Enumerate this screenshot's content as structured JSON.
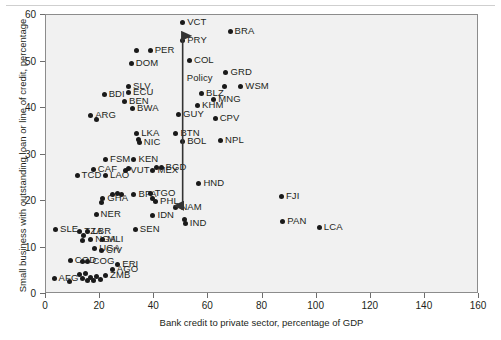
{
  "chart_data": {
    "type": "scatter",
    "title": "",
    "xlabel": "Bank credit to private sector, percentage of GDP",
    "ylabel": "Small business with outstanding loan or line of credit, percentage",
    "xlim": [
      0,
      160
    ],
    "ylim": [
      0,
      60
    ],
    "xticks": [
      0,
      20,
      40,
      60,
      80,
      100,
      120,
      140,
      160
    ],
    "yticks": [
      0,
      10,
      20,
      30,
      40,
      50,
      60
    ],
    "grid": false,
    "legend": "none",
    "annotations": [
      {
        "text": "Policy",
        "type": "double-headed-vertical-arrow",
        "x": 50.5,
        "y_from": 19.0,
        "y_to": 55.5,
        "label_x": 52,
        "label_y": 46.5
      }
    ],
    "points": [
      {
        "label": "VCT",
        "x": 50.5,
        "y": 58.4
      },
      {
        "label": "BRA",
        "x": 68.0,
        "y": 56.4
      },
      {
        "label": "PRY",
        "x": 50.5,
        "y": 54.6
      },
      {
        "label": "PER",
        "x": 38.5,
        "y": 52.4
      },
      {
        "label": "",
        "x": 33.5,
        "y": 52.4
      },
      {
        "label": "COL",
        "x": 53.0,
        "y": 50.3
      },
      {
        "label": "DOM",
        "x": 31.5,
        "y": 49.6
      },
      {
        "label": "GRD",
        "x": 66.5,
        "y": 47.6
      },
      {
        "label": "",
        "x": 66.0,
        "y": 44.6
      },
      {
        "label": "WSM",
        "x": 72.0,
        "y": 44.6
      },
      {
        "label": "SLV",
        "x": 30.5,
        "y": 44.7
      },
      {
        "label": "ECU",
        "x": 30.5,
        "y": 43.4
      },
      {
        "label": "BDI",
        "x": 21.5,
        "y": 43.0
      },
      {
        "label": "BLZ",
        "x": 57.5,
        "y": 43.2
      },
      {
        "label": "MNG",
        "x": 62.0,
        "y": 41.8
      },
      {
        "label": "BEN",
        "x": 29.0,
        "y": 41.5
      },
      {
        "label": "KHM",
        "x": 56.0,
        "y": 40.6
      },
      {
        "label": "BWA",
        "x": 32.0,
        "y": 40.0
      },
      {
        "label": "GUY",
        "x": 49.0,
        "y": 38.5
      },
      {
        "label": "ARG",
        "x": 16.5,
        "y": 38.3
      },
      {
        "label": "",
        "x": 18.5,
        "y": 37.6
      },
      {
        "label": "CPV",
        "x": 62.5,
        "y": 37.8
      },
      {
        "label": "BTN",
        "x": 48.0,
        "y": 34.6
      },
      {
        "label": "LKA",
        "x": 33.5,
        "y": 34.6
      },
      {
        "label": "NPL",
        "x": 64.5,
        "y": 33.0
      },
      {
        "label": "BOL",
        "x": 50.5,
        "y": 32.8
      },
      {
        "label": "NIC",
        "x": 34.5,
        "y": 32.6
      },
      {
        "label": "",
        "x": 34.0,
        "y": 33.2
      },
      {
        "label": "FSM",
        "x": 22.0,
        "y": 29.0
      },
      {
        "label": "KEN",
        "x": 32.5,
        "y": 29.0
      },
      {
        "label": "BGD",
        "x": 42.5,
        "y": 27.2
      },
      {
        "label": "",
        "x": 41.0,
        "y": 27.3
      },
      {
        "label": "MEX",
        "x": 39.5,
        "y": 26.6
      },
      {
        "label": "CAF",
        "x": 17.5,
        "y": 26.7
      },
      {
        "label": "VUT",
        "x": 29.5,
        "y": 26.5
      },
      {
        "label": "",
        "x": 30.5,
        "y": 26.9
      },
      {
        "label": "LAO",
        "x": 22.0,
        "y": 25.4
      },
      {
        "label": "TCD",
        "x": 11.5,
        "y": 25.4
      },
      {
        "label": "HND",
        "x": 56.5,
        "y": 23.7
      },
      {
        "label": "TGO",
        "x": 38.5,
        "y": 21.6
      },
      {
        "label": "",
        "x": 39.5,
        "y": 20.6
      },
      {
        "label": "BFA",
        "x": 32.5,
        "y": 21.4
      },
      {
        "label": "",
        "x": 28.0,
        "y": 21.5
      },
      {
        "label": "",
        "x": 26.5,
        "y": 21.6
      },
      {
        "label": "",
        "x": 24.5,
        "y": 21.3
      },
      {
        "label": "GHA",
        "x": 21.0,
        "y": 20.6
      },
      {
        "label": "",
        "x": 20.5,
        "y": 19.6
      },
      {
        "label": "PHL",
        "x": 40.5,
        "y": 20.0
      },
      {
        "label": "NAM",
        "x": 48.0,
        "y": 18.6
      },
      {
        "label": "FJI",
        "x": 87.0,
        "y": 21.0
      },
      {
        "label": "PAN",
        "x": 87.5,
        "y": 15.6
      },
      {
        "label": "LCA",
        "x": 101.0,
        "y": 14.3
      },
      {
        "label": "NER",
        "x": 18.5,
        "y": 17.2
      },
      {
        "label": "IDN",
        "x": 39.5,
        "y": 16.8
      },
      {
        "label": "IND",
        "x": 51.5,
        "y": 15.2
      },
      {
        "label": "",
        "x": 51.0,
        "y": 16.0
      },
      {
        "label": "SLE",
        "x": 3.5,
        "y": 13.9
      },
      {
        "label": "SEN",
        "x": 33.0,
        "y": 13.8
      },
      {
        "label": "TZA",
        "x": 12.5,
        "y": 13.5
      },
      {
        "label": "LBR",
        "x": 15.5,
        "y": 13.4
      },
      {
        "label": "",
        "x": 14.0,
        "y": 12.5
      },
      {
        "label": "NGA",
        "x": 16.5,
        "y": 11.8
      },
      {
        "label": "MLI",
        "x": 21.0,
        "y": 11.8
      },
      {
        "label": "",
        "x": 13.5,
        "y": 11.4
      },
      {
        "label": "UGA",
        "x": 18.0,
        "y": 9.7
      },
      {
        "label": "CIV",
        "x": 20.5,
        "y": 9.4
      },
      {
        "label": "COD",
        "x": 9.0,
        "y": 7.3
      },
      {
        "label": "COG",
        "x": 15.5,
        "y": 7.0
      },
      {
        "label": "",
        "x": 13.5,
        "y": 7.0
      },
      {
        "label": "ERI",
        "x": 26.5,
        "y": 6.4
      },
      {
        "label": "ZMB",
        "x": 22.0,
        "y": 4.0
      },
      {
        "label": "AGO",
        "x": 24.5,
        "y": 5.2
      },
      {
        "label": "AFG",
        "x": 3.0,
        "y": 3.4
      },
      {
        "label": "",
        "x": 8.5,
        "y": 2.6
      },
      {
        "label": "",
        "x": 12.5,
        "y": 4.1
      },
      {
        "label": "",
        "x": 13.5,
        "y": 3.4
      },
      {
        "label": "",
        "x": 14.5,
        "y": 4.4
      },
      {
        "label": "",
        "x": 15.5,
        "y": 3.0
      },
      {
        "label": "",
        "x": 16.5,
        "y": 3.6
      },
      {
        "label": "",
        "x": 17.5,
        "y": 2.9
      },
      {
        "label": "",
        "x": 18.5,
        "y": 3.8
      },
      {
        "label": "",
        "x": 20.0,
        "y": 3.1
      }
    ]
  }
}
